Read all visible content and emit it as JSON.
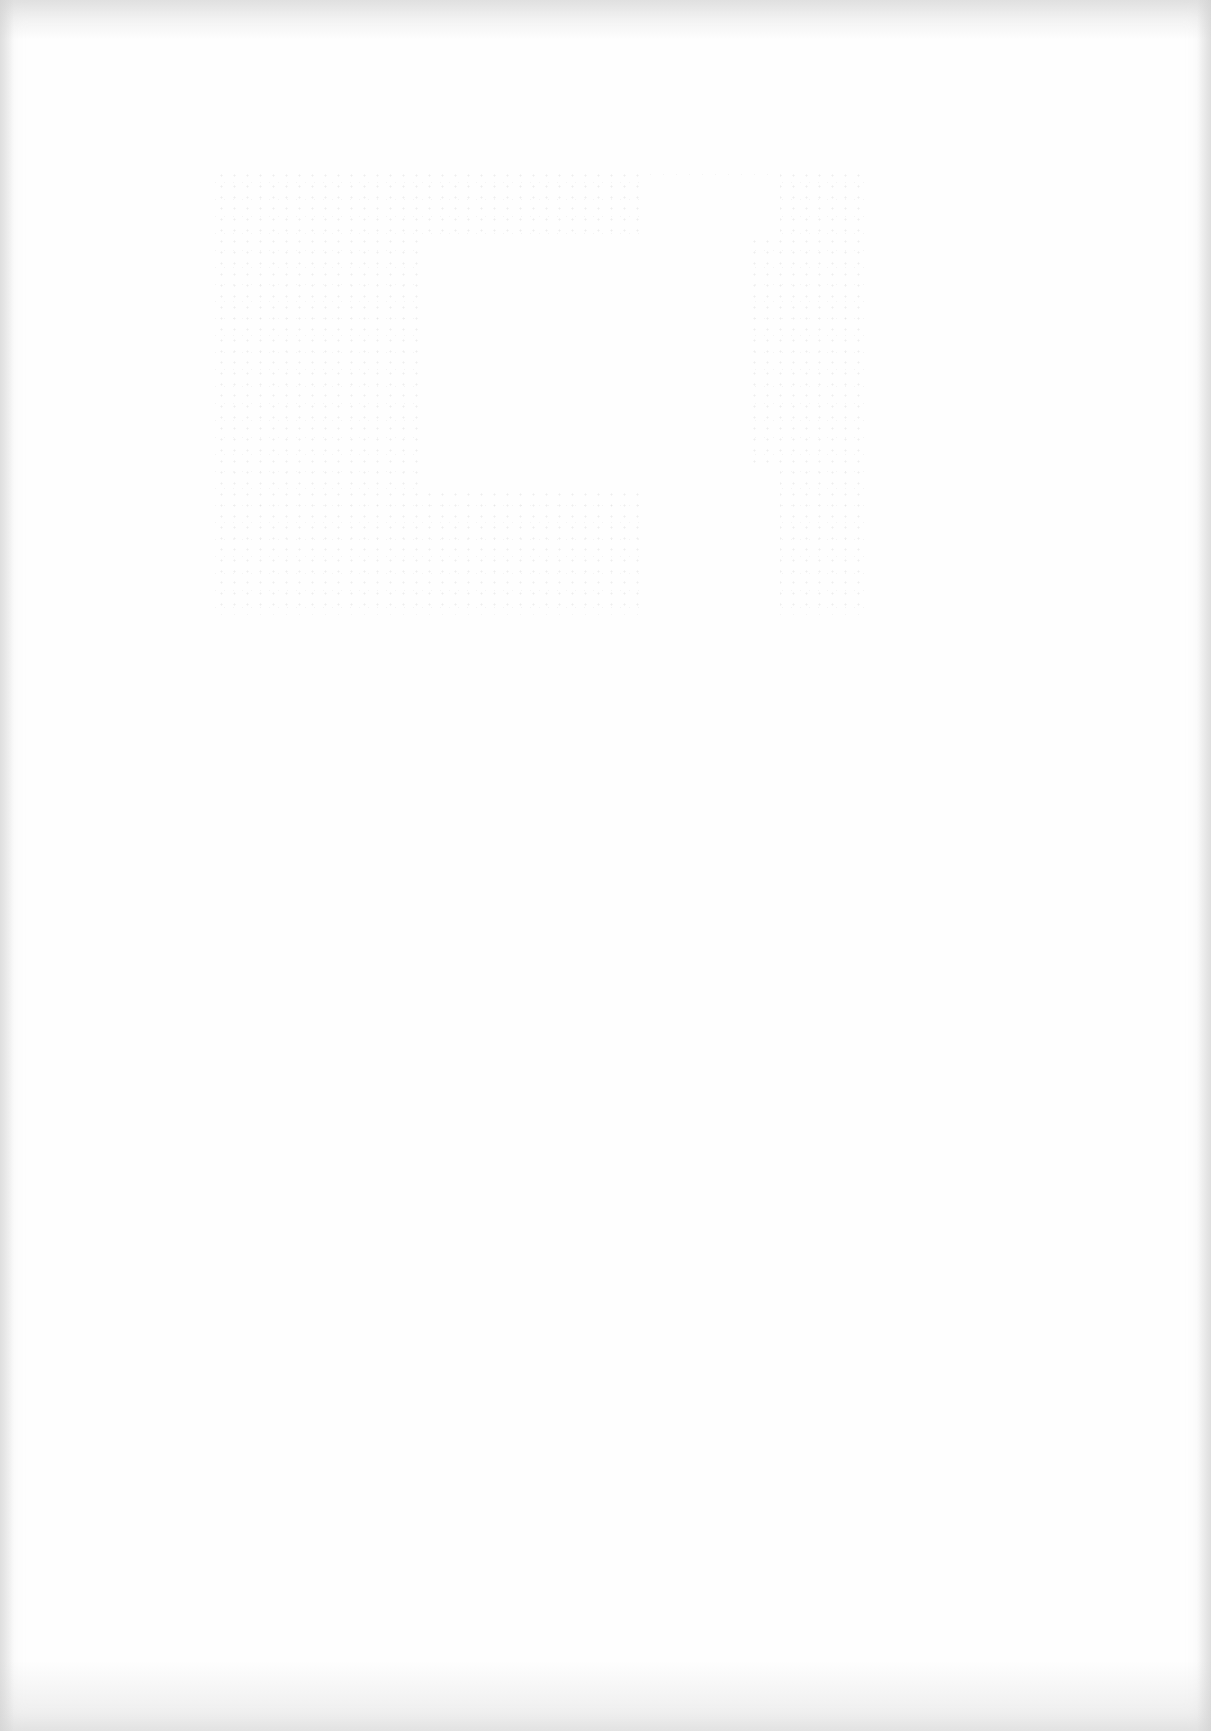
{
  "document": {
    "type": "blank scanned page",
    "text": "",
    "ghost_region": {
      "description": "faint bleed-through speckle, no legible content"
    }
  }
}
